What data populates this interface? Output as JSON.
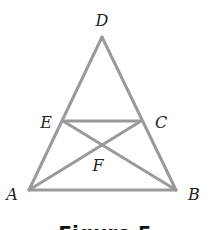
{
  "figure": {
    "caption": "Figure 5",
    "line_color": "#9a9a9a",
    "line_width": 3,
    "points": {
      "D": {
        "x": 102,
        "y": 37,
        "label": "D",
        "lx": 102,
        "ly": 26,
        "anchor": "middle"
      },
      "E": {
        "x": 63,
        "y": 121,
        "label": "E",
        "lx": 46,
        "ly": 128,
        "anchor": "middle"
      },
      "C": {
        "x": 141,
        "y": 121,
        "label": "C",
        "lx": 161,
        "ly": 128,
        "anchor": "middle"
      },
      "F": {
        "x": 104,
        "y": 145,
        "label": "F",
        "lx": 98,
        "ly": 171,
        "anchor": "middle"
      },
      "A": {
        "x": 29,
        "y": 190,
        "label": "A",
        "lx": 12,
        "ly": 200,
        "anchor": "middle"
      },
      "B": {
        "x": 176,
        "y": 190,
        "label": "B",
        "lx": 194,
        "ly": 200,
        "anchor": "middle"
      }
    },
    "segments": [
      [
        "A",
        "D"
      ],
      [
        "D",
        "B"
      ],
      [
        "A",
        "B"
      ],
      [
        "E",
        "C"
      ],
      [
        "E",
        "B"
      ],
      [
        "A",
        "C"
      ]
    ]
  }
}
